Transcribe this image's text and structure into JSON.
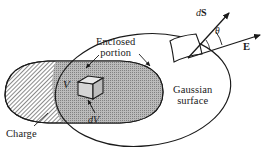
{
  "figure": {
    "kind": "physics-diagram",
    "topic": "Gauss's law: Gaussian surface enclosing part of a charge distribution",
    "background_color": "#ffffff",
    "ink_color": "#1a1a1a"
  },
  "labels": {
    "enclosed_line1": "Enclosed",
    "enclosed_line2": "portion",
    "gaussian_line1": "Gaussian",
    "gaussian_line2": "surface",
    "charge": "Charge",
    "volume": "V",
    "volume_element": "dV",
    "area_vector_d": "d",
    "area_vector_S": "S",
    "field_vector": "E",
    "angle": "θ"
  },
  "shapes": {
    "gaussian_surface": {
      "name": "gaussian-surface-ellipse",
      "type": "ellipse",
      "cx": 143,
      "cy": 90,
      "rx": 88,
      "ry": 56,
      "rotation_deg": -6,
      "stroke": "#1a1a1a",
      "fill": "none"
    },
    "charge_blob": {
      "name": "charge-distribution-blob",
      "type": "rounded-blob",
      "outside_fill": "hatch",
      "inside_fill": "stipple-gray",
      "stroke": "#1a1a1a"
    },
    "volume_element_cube": {
      "name": "volume-element-cube",
      "type": "cube",
      "stroke": "#1a1a1a",
      "fill": "#cfcfcf"
    },
    "surface_patch": {
      "name": "surface-area-patch",
      "type": "curved-quad",
      "stroke": "#1a1a1a",
      "fill": "#ffffff"
    }
  },
  "vectors": [
    {
      "name": "dS-vector",
      "label": "dS",
      "from": [
        188,
        58
      ],
      "to": [
        228,
        14
      ],
      "description": "area element vector, normal to the surface patch"
    },
    {
      "name": "E-vector",
      "label": "E",
      "from": [
        188,
        58
      ],
      "to": [
        262,
        35
      ],
      "description": "electric field vector"
    }
  ],
  "leader_lines": [
    {
      "name": "enclosed-portion-leader",
      "from": [
        100,
        56
      ],
      "to": [
        85,
        70
      ]
    },
    {
      "name": "enclosed-portion-leader-2",
      "from": [
        138,
        56
      ],
      "to": [
        150,
        72
      ]
    },
    {
      "name": "charge-leader",
      "from": [
        35,
        126
      ],
      "to": [
        48,
        112
      ]
    },
    {
      "name": "dV-leader",
      "from": [
        95,
        113
      ],
      "to": [
        88,
        98
      ]
    }
  ],
  "angle_arc": {
    "name": "theta-angle-arc",
    "vertex": [
      188,
      58
    ],
    "between": [
      "dS-vector",
      "E-vector"
    ]
  }
}
